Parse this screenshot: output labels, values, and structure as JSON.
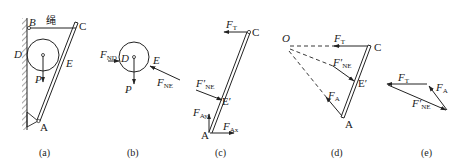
{
  "figure": {
    "panels": [
      {
        "id": "a",
        "caption": "(a)",
        "labels": {
          "B": "B",
          "C": "C",
          "D": "D",
          "E": "E",
          "P": "P",
          "A": "A",
          "rope": "绳"
        }
      },
      {
        "id": "b",
        "caption": "(b)",
        "labels": {
          "D": "D",
          "E": "E",
          "P": "P",
          "F_ND": "F",
          "F_ND_sub": "ND",
          "F_NE": "F",
          "F_NE_sub": "NE"
        }
      },
      {
        "id": "c",
        "caption": "(c)",
        "labels": {
          "C": "C",
          "A": "A",
          "E_prime": "E′",
          "F_T": "F",
          "F_T_sub": "T",
          "F_NE_prime": "F′",
          "F_NE_prime_sub": "NE",
          "F_Ay": "F",
          "F_Ay_sub": "Ay",
          "F_Ax": "F",
          "F_Ax_sub": "Ax"
        }
      },
      {
        "id": "d",
        "caption": "(d)",
        "labels": {
          "O": "O",
          "C": "C",
          "A": "A",
          "E_prime": "E′",
          "F_T": "F",
          "F_T_sub": "T",
          "F_NE_prime": "F′",
          "F_NE_prime_sub": "NE",
          "F_A": "F",
          "F_A_sub": "A"
        }
      },
      {
        "id": "e",
        "caption": "(e)",
        "labels": {
          "F_T": "F",
          "F_T_sub": "T",
          "F_A": "F",
          "F_A_sub": "A",
          "F_NE_prime": "F′",
          "F_NE_prime_sub": "NE"
        }
      }
    ]
  },
  "colors": {
    "ink": "#222222",
    "background": "#ffffff"
  }
}
